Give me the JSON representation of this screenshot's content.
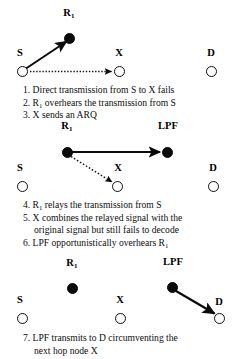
{
  "figure": {
    "background_color": "#ffffff",
    "ink_color": "#000000",
    "node_fill_color": "#0a0a0a",
    "node_open_color": "#ffffff"
  },
  "panels": [
    {
      "id": "panel-1",
      "nodes": [
        {
          "id": "r1",
          "label": "R",
          "sub": "1",
          "style": "filled",
          "x": 69,
          "y": 38,
          "label_x": 69,
          "label_y": 11
        },
        {
          "id": "s",
          "label": "S",
          "sub": "",
          "style": "open",
          "x": 22,
          "y": 71,
          "label_x": 20,
          "label_y": 51
        },
        {
          "id": "x",
          "label": "X",
          "sub": "",
          "style": "open",
          "x": 119,
          "y": 71,
          "label_x": 119,
          "label_y": 51
        },
        {
          "id": "d",
          "label": "D",
          "sub": "",
          "style": "open",
          "x": 211,
          "y": 71,
          "label_x": 211,
          "label_y": 51
        }
      ],
      "edges": [
        {
          "id": "s-to-r1",
          "from": "s",
          "to": "r1",
          "style": "solid",
          "arrow": true
        },
        {
          "id": "s-to-x",
          "from": "s",
          "to": "x",
          "style": "dotted",
          "arrow": true
        }
      ],
      "caption": [
        {
          "text": "1. Direct transmission from S to X fails",
          "sub_after": "",
          "indent": false
        },
        {
          "text": "2. R",
          "sub_after": "1",
          "tail": " overhears the transmission from S",
          "indent": false
        },
        {
          "text": "3. X sends an ARQ",
          "sub_after": "",
          "indent": false
        }
      ]
    },
    {
      "id": "panel-2",
      "nodes": [
        {
          "id": "r1",
          "label": "R",
          "sub": "1",
          "style": "filled",
          "x": 67,
          "y": 152,
          "label_x": 67,
          "label_y": 126
        },
        {
          "id": "lpf",
          "label": "LPF",
          "sub": "",
          "style": "filled",
          "x": 167,
          "y": 152,
          "label_x": 168,
          "label_y": 126
        },
        {
          "id": "s",
          "label": "S",
          "sub": "",
          "style": "open",
          "x": 22,
          "y": 186,
          "label_x": 20,
          "label_y": 166
        },
        {
          "id": "x",
          "label": "X",
          "sub": "",
          "style": "open",
          "x": 117,
          "y": 186,
          "label_x": 118,
          "label_y": 166
        },
        {
          "id": "d",
          "label": "D",
          "sub": "",
          "style": "open",
          "x": 213,
          "y": 186,
          "label_x": 213,
          "label_y": 166
        }
      ],
      "edges": [
        {
          "id": "r1-to-lpf",
          "from": "r1",
          "to": "lpf",
          "style": "solid",
          "arrow": true
        },
        {
          "id": "r1-to-x",
          "from": "r1",
          "to": "x",
          "style": "dotted",
          "arrow": true
        }
      ],
      "caption": [
        {
          "text": "4. R",
          "sub_after": "1",
          "tail": " relays the transmission from S",
          "indent": false
        },
        {
          "text": "5. X combines the relayed signal with the",
          "sub_after": "",
          "indent": false
        },
        {
          "text": "original signal but still fails to decode",
          "sub_after": "",
          "indent": true
        },
        {
          "text": "6. LPF opportunistically overhears R",
          "sub_after": "1",
          "tail": "",
          "indent": false
        }
      ]
    },
    {
      "id": "panel-3",
      "nodes": [
        {
          "id": "r1",
          "label": "R",
          "sub": "1",
          "style": "filled",
          "x": 72,
          "y": 288,
          "label_x": 72,
          "label_y": 268
        },
        {
          "id": "lpf",
          "label": "LPF",
          "sub": "",
          "style": "filled",
          "x": 172,
          "y": 287,
          "label_x": 173,
          "label_y": 267
        },
        {
          "id": "s",
          "label": "S",
          "sub": "",
          "style": "open",
          "x": 22,
          "y": 318,
          "label_x": 20,
          "label_y": 298
        },
        {
          "id": "x",
          "label": "X",
          "sub": "",
          "style": "open",
          "x": 120,
          "y": 318,
          "label_x": 120,
          "label_y": 298
        },
        {
          "id": "d",
          "label": "D",
          "sub": "",
          "style": "open",
          "x": 219,
          "y": 318,
          "label_x": 219,
          "label_y": 299
        }
      ],
      "edges": [
        {
          "id": "lpf-to-d",
          "from": "lpf",
          "to": "d",
          "style": "solid",
          "arrow": true
        }
      ],
      "caption": [
        {
          "text": "7. LPF transmits to D circumventing the",
          "sub_after": "",
          "indent": false
        },
        {
          "text": "next hop node X",
          "sub_after": "",
          "indent": true
        }
      ]
    }
  ],
  "captions": {
    "line1": "1. Direct transmission from S to X fails",
    "line2_head": "2. R",
    "line2_sub": "1",
    "line2_tail": " overhears the transmission from S",
    "line3": "3. X sends an ARQ",
    "line4_head": "4. R",
    "line4_sub": "1",
    "line4_tail": " relays the transmission from S",
    "line5a": "5. X combines the relayed signal with the",
    "line5b": "original signal but still fails to decode",
    "line6_head": "6. LPF opportunistically overhears R",
    "line6_sub": "1",
    "line7a": "7. LPF transmits to D circumventing the",
    "line7b": "next hop node X"
  },
  "labels": {
    "r1": "R",
    "r1_sub": "1",
    "s": "S",
    "x": "X",
    "d": "D",
    "lpf": "LPF"
  }
}
